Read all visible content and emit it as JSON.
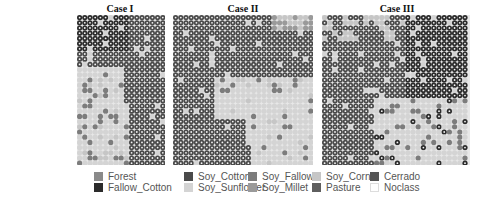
{
  "figure": {
    "panels": [
      {
        "title": "Case I"
      },
      {
        "title": "Case II"
      },
      {
        "title": "Case III"
      }
    ]
  },
  "legend": {
    "items": [
      {
        "label": "Forest",
        "color": "#8a8a8a"
      },
      {
        "label": "Fallow_Cotton",
        "color": "#2b2b2b"
      },
      {
        "label": "Soy_Cotton",
        "color": "#4a4a4a"
      },
      {
        "label": "Soy_Sunflower",
        "color": "#d4d4d4"
      },
      {
        "label": "Soy_Fallow",
        "color": "#7c7c7c"
      },
      {
        "label": "Soy_Millet",
        "color": "#9a9a9a"
      },
      {
        "label": "Soy_Corn",
        "color": "#c6c6c6"
      },
      {
        "label": "Pasture",
        "color": "#5e5e5e"
      },
      {
        "label": "Cerrado",
        "color": "#555555"
      },
      {
        "label": "Noclass",
        "color": "#ffffff"
      }
    ]
  }
}
